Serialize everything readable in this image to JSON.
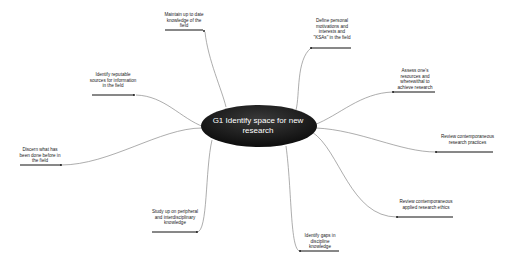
{
  "diagram": {
    "type": "mind-map",
    "central_topic": {
      "label": "G1 Identify space for new research",
      "fill": "#1a1a1a",
      "text_color": "#ffffff"
    },
    "branches": [
      {
        "id": "b1",
        "label": "Maintain up to date knowledge of the field"
      },
      {
        "id": "b2",
        "label": "Define personal motivations and interests and \"KSAs\" in the field"
      },
      {
        "id": "b3",
        "label": "Identify reputable sources for information in the field"
      },
      {
        "id": "b4",
        "label": "Assess one's resources and wherewithal to achieve research"
      },
      {
        "id": "b5",
        "label": "Review contemporaneous research practices"
      },
      {
        "id": "b6",
        "label": "Discern what has been done before in the field"
      },
      {
        "id": "b7",
        "label": "Review contemporaneous applied research ethics"
      },
      {
        "id": "b8",
        "label": "Study up on peripheral and interdisciplinary knowledge"
      },
      {
        "id": "b9",
        "label": "Identify gaps in discipline knowledge"
      }
    ],
    "colors": {
      "connector": "#888888",
      "underline": "#111111",
      "background": "#ffffff"
    }
  }
}
